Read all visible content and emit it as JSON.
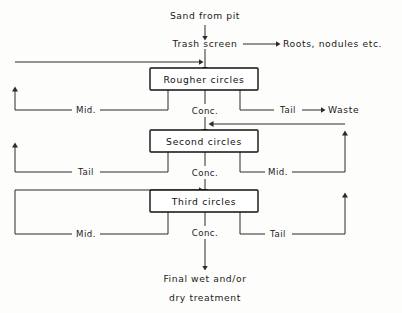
{
  "diagram": {
    "colors": {
      "background": "#fdfdfb",
      "line": "#2b2b2b",
      "box_border": "#111111",
      "text": "#1a1a1a"
    },
    "inputs": {
      "feed": "Sand from pit"
    },
    "nodes": [
      {
        "id": "trash-screen",
        "label": "Trash screen",
        "kind": "text-node"
      },
      {
        "id": "rougher-circles",
        "label": "Rougher circles",
        "kind": "box"
      },
      {
        "id": "second-circles",
        "label": "Second circles",
        "kind": "box"
      },
      {
        "id": "third-circles",
        "label": "Third circles",
        "kind": "box"
      }
    ],
    "outputs": [
      {
        "id": "reject-roots",
        "label": "Roots, nodules etc."
      },
      {
        "id": "reject-waste",
        "label": "Waste"
      }
    ],
    "final_product": {
      "line1": "Final  wet  and/or",
      "line2": "dry  treatment"
    },
    "streams": {
      "rougher": {
        "mid": "Mid.",
        "conc": "Conc.",
        "tail": "Tail"
      },
      "second": {
        "tail": "Tail",
        "conc": "Conc.",
        "mid": "Mid."
      },
      "third": {
        "mid": "Mid.",
        "conc": "Conc.",
        "tail": "Tail"
      }
    }
  }
}
